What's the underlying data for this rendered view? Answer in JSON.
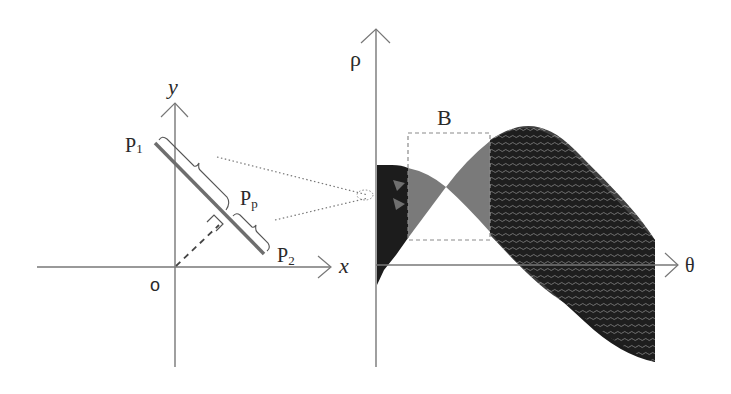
{
  "left_panel": {
    "x_axis_label": "x",
    "y_axis_label": "y",
    "origin_label": "o",
    "p1_label": "P",
    "p1_sub": "1",
    "p2_label": "P",
    "p2_sub": "2",
    "pp_label": "P",
    "pp_sub": "p"
  },
  "right_panel": {
    "rho_axis_label": "ρ",
    "theta_axis_label": "θ",
    "box_label": "B"
  },
  "colors": {
    "axis": "#777777",
    "segment": "#6e6e6e",
    "dark_fill": "#1c1c1c",
    "gray_fill": "#7a7a7a",
    "box_dash": "#8a8a8a"
  }
}
